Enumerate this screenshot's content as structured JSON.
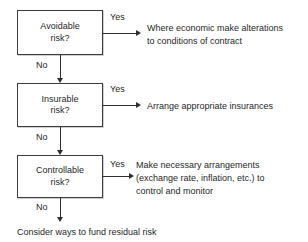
{
  "diagram": {
    "colors": {
      "background": "#ffffff",
      "box_border": "#3c3c3c",
      "connector": "#2e2e2e",
      "text": "#1f1f1f"
    },
    "decisions": [
      {
        "id": "avoidable",
        "line1": "Avoidable",
        "line2": "risk?",
        "yes_label": "Yes",
        "no_label": "No",
        "yes_outcome": [
          "Where economic make alterations",
          "to conditions of contract"
        ]
      },
      {
        "id": "insurable",
        "line1": "Insurable",
        "line2": "risk?",
        "yes_label": "Yes",
        "no_label": "No",
        "yes_outcome": [
          "Arrange appropriate insurances"
        ]
      },
      {
        "id": "controllable",
        "line1": "Controllable",
        "line2": "risk?",
        "yes_label": "Yes",
        "no_label": "No",
        "yes_outcome": [
          "Make necessary arrangements",
          "(exchange rate, inflation, etc.) to",
          "control and monitor"
        ]
      }
    ],
    "final_outcome": "Consider ways to fund residual risk"
  }
}
